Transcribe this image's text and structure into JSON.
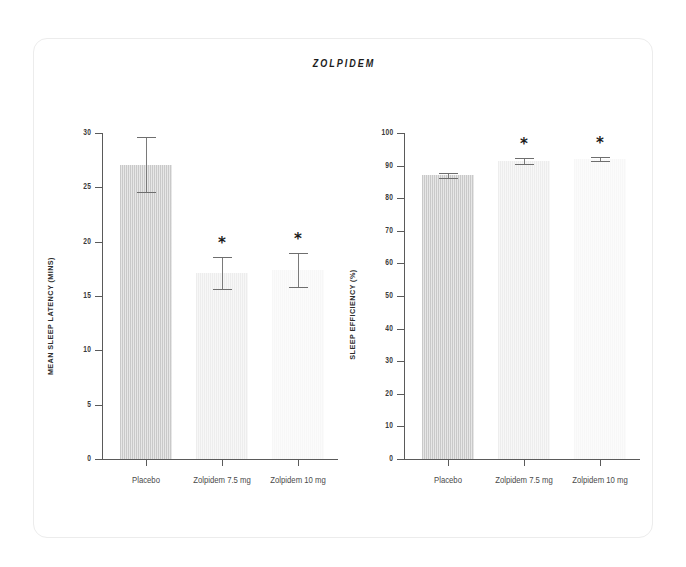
{
  "figure": {
    "title": "ZOLPIDEM"
  },
  "chart_data": [
    {
      "type": "bar",
      "id": "mean-sleep-latency",
      "title": "ZOLPIDEM",
      "xlabel": "",
      "ylabel": "MEAN SLEEP LATENCY (MINS)",
      "ylim": [
        0,
        30
      ],
      "yticks": [
        0,
        5,
        10,
        15,
        20,
        25,
        30
      ],
      "ytick_labels": [
        "0",
        "5",
        "10",
        "15",
        "20",
        "25",
        "30"
      ],
      "grid": false,
      "legend": "none",
      "categories": [
        "Placebo",
        "Zolpidem 7.5 mg",
        "Zolpidem 10 mg"
      ],
      "values": [
        27.1,
        17.1,
        17.4
      ],
      "errors": [
        2.5,
        1.5,
        1.6
      ],
      "error_low": [
        24.6,
        15.6,
        15.8
      ],
      "error_high": [
        29.6,
        18.6,
        19.0
      ],
      "annotations": [
        null,
        "*",
        "*"
      ],
      "bar_colors": [
        "#c9c9c9",
        "#ededed",
        "#f7f7f7"
      ]
    },
    {
      "type": "bar",
      "id": "sleep-efficiency",
      "title": "ZOLPIDEM",
      "xlabel": "",
      "ylabel": "SLEEP EFFICIENCY (%)",
      "ylim": [
        0,
        100
      ],
      "yticks": [
        0,
        10,
        20,
        30,
        40,
        50,
        60,
        70,
        80,
        90,
        100
      ],
      "ytick_labels": [
        "0",
        "10",
        "20",
        "30",
        "40",
        "50",
        "60",
        "70",
        "80",
        "90",
        "100"
      ],
      "grid": false,
      "legend": "none",
      "categories": [
        "Placebo",
        "Zolpidem 7.5 mg",
        "Zolpidem 10 mg"
      ],
      "values": [
        87.0,
        91.4,
        92.0
      ],
      "errors": [
        0.8,
        1.0,
        0.6
      ],
      "error_low": [
        86.2,
        90.4,
        91.4
      ],
      "error_high": [
        87.8,
        92.4,
        92.6
      ],
      "annotations": [
        null,
        "*",
        "*"
      ],
      "bar_colors": [
        "#c9c9c9",
        "#ededed",
        "#f7f7f7"
      ]
    }
  ]
}
